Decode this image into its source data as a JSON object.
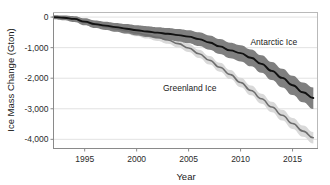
{
  "chart_data": {
    "type": "line",
    "title": "",
    "xlabel": "Year",
    "ylabel": "Ice Mass Change (Gton)",
    "xlim": [
      1992,
      2017.4
    ],
    "ylim": [
      -4300,
      150
    ],
    "xticks": [
      1995,
      2000,
      2005,
      2010,
      2015
    ],
    "xtick_labels": [
      "1995",
      "2000",
      "2005",
      "2010",
      "2015"
    ],
    "yticks": [
      0,
      -1000,
      -2000,
      -3000,
      -4000
    ],
    "ytick_labels": [
      "0",
      "-1,000",
      "-2,000",
      "-3,000",
      "-4,000"
    ],
    "grid": "horizontal",
    "legend_position": "inline-annotations",
    "colors": {
      "antarctic_line": "#111111",
      "antarctic_band": "#7f7f7f",
      "greenland_line": "#6e6e6e",
      "greenland_band": "#d9d9d9",
      "axis": "#888888",
      "grid": "#e2e2e2",
      "text": "#1a1a1a"
    },
    "x": [
      1992,
      1993,
      1994,
      1995,
      1996,
      1997,
      1998,
      1999,
      2000,
      2001,
      2002,
      2003,
      2004,
      2005,
      2006,
      2007,
      2008,
      2009,
      2010,
      2011,
      2012,
      2013,
      2014,
      2015,
      2016,
      2017
    ],
    "series": [
      {
        "name": "Antarctic Ice",
        "label": "Antarctic Ice",
        "line_color": "#111111",
        "band_color": "#7f7f7f",
        "annotation_x": 2013.2,
        "annotation_y": -900,
        "values": [
          0,
          -20,
          -60,
          -150,
          -230,
          -280,
          -330,
          -380,
          -430,
          -470,
          -510,
          -545,
          -590,
          -640,
          -720,
          -830,
          -960,
          -1090,
          -1180,
          -1330,
          -1530,
          -1760,
          -1990,
          -2230,
          -2460,
          -2650
        ],
        "band_lower": [
          -70,
          -100,
          -160,
          -270,
          -360,
          -420,
          -480,
          -540,
          -600,
          -650,
          -700,
          -745,
          -800,
          -860,
          -950,
          -1070,
          -1210,
          -1350,
          -1450,
          -1610,
          -1820,
          -2060,
          -2300,
          -2550,
          -2790,
          -3010
        ],
        "band_upper": [
          60,
          50,
          30,
          -40,
          -110,
          -150,
          -190,
          -230,
          -270,
          -300,
          -330,
          -355,
          -390,
          -430,
          -500,
          -600,
          -720,
          -840,
          -920,
          -1060,
          -1250,
          -1470,
          -1690,
          -1920,
          -2140,
          -2300
        ]
      },
      {
        "name": "Greenland Ice",
        "label": "Greenland Ice",
        "line_color": "#6e6e6e",
        "band_color": "#d9d9d9",
        "annotation_x": 2005.1,
        "annotation_y": -2420,
        "values": [
          0,
          -25,
          -70,
          -170,
          -255,
          -320,
          -385,
          -450,
          -520,
          -590,
          -665,
          -750,
          -870,
          -1010,
          -1200,
          -1410,
          -1640,
          -1880,
          -2140,
          -2400,
          -2670,
          -2940,
          -3210,
          -3480,
          -3730,
          -3950
        ],
        "band_lower": [
          -60,
          -90,
          -140,
          -250,
          -340,
          -410,
          -480,
          -550,
          -625,
          -700,
          -780,
          -870,
          -995,
          -1140,
          -1335,
          -1550,
          -1785,
          -2030,
          -2295,
          -2560,
          -2835,
          -3110,
          -3385,
          -3660,
          -3915,
          -4140
        ],
        "band_upper": [
          60,
          40,
          0,
          -90,
          -170,
          -230,
          -290,
          -350,
          -415,
          -480,
          -550,
          -630,
          -745,
          -880,
          -1065,
          -1270,
          -1495,
          -1730,
          -1985,
          -2240,
          -2505,
          -2770,
          -3035,
          -3300,
          -3545,
          -3760
        ]
      }
    ]
  },
  "axes": {
    "y_axis_title": "Ice Mass Change (Gton)",
    "x_axis_title": "Year"
  }
}
